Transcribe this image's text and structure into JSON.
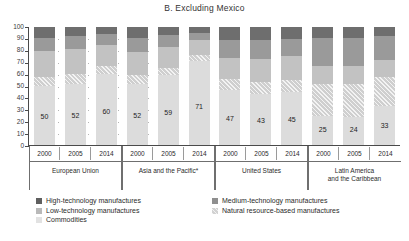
{
  "chart_data": {
    "type": "bar",
    "title": "B. Excluding Mexico",
    "subtitle": "",
    "xlabel": "",
    "ylabel": "",
    "ylim": [
      0,
      100
    ],
    "yticks": [
      0,
      10,
      20,
      30,
      40,
      50,
      60,
      70,
      80,
      90,
      100
    ],
    "grid": false,
    "stacked": true,
    "legend_position": "bottom",
    "groups": [
      {
        "name": "European Union",
        "categories": [
          "2000",
          "2005",
          "2014"
        ]
      },
      {
        "name": "Asia and the Pacific*",
        "categories": [
          "2000",
          "2005",
          "2014"
        ]
      },
      {
        "name": "United States",
        "categories": [
          "2000",
          "2005",
          "2014"
        ]
      },
      {
        "name": "Latin America and the Caribbean",
        "categories": [
          "2000",
          "2005",
          "2014"
        ]
      }
    ],
    "categories": [
      "EU 2000",
      "EU 2005",
      "EU 2014",
      "Asia 2000",
      "Asia 2005",
      "Asia 2014",
      "US 2000",
      "US 2005",
      "US 2014",
      "LAC 2000",
      "LAC 2005",
      "LAC 2014"
    ],
    "series": [
      {
        "name": "Commodities",
        "color": "#dcdcdc",
        "values": [
          50,
          52,
          60,
          52,
          59,
          71,
          47,
          43,
          45,
          25,
          24,
          33
        ]
      },
      {
        "name": "Natural resource-based manufactures",
        "color": "#cfcfcf",
        "hatched": true,
        "values": [
          8,
          8,
          7,
          7,
          6,
          5,
          9,
          10,
          10,
          27,
          28,
          25
        ]
      },
      {
        "name": "Low-technology manufactures",
        "color": "#c2c2c2",
        "values": [
          22,
          21,
          18,
          20,
          18,
          13,
          18,
          20,
          20,
          15,
          15,
          14
        ]
      },
      {
        "name": "Medium-technology manufactures",
        "color": "#9a9a9a",
        "values": [
          11,
          11,
          9,
          12,
          10,
          6,
          15,
          16,
          15,
          24,
          24,
          20
        ]
      },
      {
        "name": "High-technology manufactures",
        "color": "#6e6e6e",
        "values": [
          9,
          8,
          6,
          9,
          7,
          5,
          11,
          11,
          10,
          9,
          9,
          8
        ]
      }
    ],
    "bar_labels": [
      "50",
      "52",
      "60",
      "52",
      "59",
      "71",
      "47",
      "43",
      "45",
      "25",
      "24",
      "33"
    ]
  },
  "legend": {
    "column_one": [
      {
        "label": "High-technology manufactures",
        "swatch": "high"
      },
      {
        "label": "Low-technology manufactures",
        "swatch": "low"
      },
      {
        "label": "Commodities",
        "swatch": "commodities"
      }
    ],
    "column_two": [
      {
        "label": "Medium-technology manufactures",
        "swatch": "medium"
      },
      {
        "label": "Natural resource-based manufactures",
        "swatch": "natural"
      }
    ]
  },
  "axis": {
    "y_tick_labels": [
      "100",
      "90",
      "80",
      "70",
      "60",
      "50",
      "40",
      "30",
      "20",
      "10",
      "0"
    ]
  },
  "x_axis_groups": [
    {
      "region": "European Union",
      "years": [
        "2000",
        "2005",
        "2014"
      ]
    },
    {
      "region": "Asia and the Pacific*",
      "years": [
        "2000",
        "2005",
        "2014"
      ]
    },
    {
      "region": "United States",
      "years": [
        "2000",
        "2005",
        "2014"
      ]
    },
    {
      "region": "Latin America\nand the Caribbean",
      "years": [
        "2000",
        "2005",
        "2014"
      ]
    }
  ]
}
